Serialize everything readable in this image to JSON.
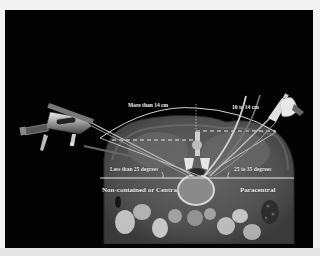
{
  "figure": {
    "labels": {
      "medial_distance": "More than 14 cm",
      "lateral_distance": "10 to 14 cm",
      "medial_angle": "Less than 25 degrees",
      "lateral_angle": "25 to 35 degrees",
      "central_zone": "Non-contained or Central",
      "paracentral_zone": "Paracentral"
    },
    "colors": {
      "background": "#030303",
      "page": "#f2f2f2",
      "label_text": "#f4f4f4",
      "guide_line": "#e8e8e8",
      "ct_soft_tissue": "#5a5a5a",
      "ct_fat": "#3a3a3a",
      "bone": "#d8d8d8"
    },
    "icons": {
      "left_instrument": "endoscope-instrument-icon",
      "right_instrument": "syringe-needle-icon"
    }
  }
}
